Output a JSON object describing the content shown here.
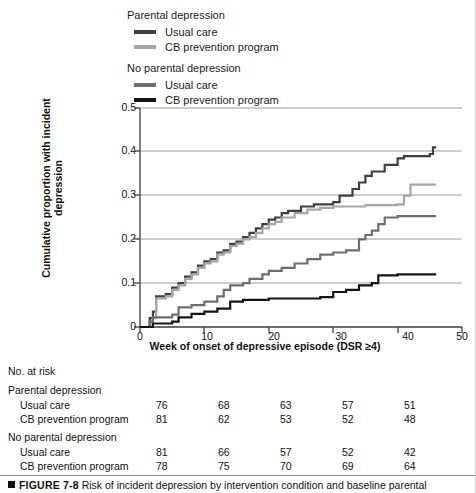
{
  "legend": {
    "groups": [
      {
        "title": "Parental depression",
        "items": [
          {
            "label": "Usual care",
            "color": "#3f3f3f"
          },
          {
            "label": "CB prevention program",
            "color": "#a6a6a6"
          }
        ]
      },
      {
        "title": "No parental depression",
        "items": [
          {
            "label": "Usual care",
            "color": "#6e6e6e"
          },
          {
            "label": "CB prevention program",
            "color": "#141414"
          }
        ]
      }
    ]
  },
  "axes": {
    "ylabel": "Cumulative proportion with incident depression",
    "xlabel": "Week of onset of depressive episode (DSR ≥4)",
    "yticks": [
      "0",
      "0.1",
      "0.2",
      "0.3",
      "0.4",
      "0.5"
    ],
    "xticks": [
      "0",
      "10",
      "20",
      "30",
      "40",
      "50"
    ]
  },
  "risk_table": {
    "title": "No. at risk",
    "sections": [
      {
        "title": "Parental depression",
        "rows": [
          {
            "name": "Usual care",
            "values": [
              "76",
              "68",
              "63",
              "57",
              "51"
            ]
          },
          {
            "name": "CB prevention program",
            "values": [
              "81",
              "62",
              "53",
              "52",
              "48"
            ]
          }
        ]
      },
      {
        "title": "No parental depression",
        "rows": [
          {
            "name": "Usual care",
            "values": [
              "81",
              "66",
              "57",
              "52",
              "42"
            ]
          },
          {
            "name": "CB prevention program",
            "values": [
              "78",
              "75",
              "70",
              "69",
              "64"
            ]
          }
        ]
      }
    ]
  },
  "caption": {
    "figure_number": "FIGURE 7-8",
    "text": "Risk of incident depression by intervention condition and baseline parental"
  },
  "chart_data": {
    "type": "line",
    "title": "",
    "xlabel": "Week of onset of depressive episode (DSR ≥4)",
    "ylabel": "Cumulative proportion with incident depression",
    "xlim": [
      0,
      50
    ],
    "ylim": [
      0,
      0.5
    ],
    "xticks": [
      0,
      10,
      20,
      30,
      40,
      50
    ],
    "yticks": [
      0,
      0.1,
      0.2,
      0.3,
      0.4,
      0.5
    ],
    "grid": "horizontal",
    "legend_position": "above-plot",
    "step_style": "post",
    "series": [
      {
        "name": "Parental depression — Usual care",
        "color": "#3f3f3f",
        "points": [
          [
            0,
            0.0
          ],
          [
            1.5,
            0.02
          ],
          [
            2,
            0.035
          ],
          [
            2.5,
            0.07
          ],
          [
            4,
            0.075
          ],
          [
            5,
            0.09
          ],
          [
            6,
            0.1
          ],
          [
            7,
            0.115
          ],
          [
            8,
            0.125
          ],
          [
            9,
            0.14
          ],
          [
            10,
            0.15
          ],
          [
            11,
            0.155
          ],
          [
            12,
            0.17
          ],
          [
            13,
            0.175
          ],
          [
            14,
            0.19
          ],
          [
            15,
            0.195
          ],
          [
            16,
            0.205
          ],
          [
            17,
            0.215
          ],
          [
            18,
            0.225
          ],
          [
            19,
            0.235
          ],
          [
            20,
            0.245
          ],
          [
            21,
            0.25
          ],
          [
            22,
            0.26
          ],
          [
            23,
            0.265
          ],
          [
            25,
            0.275
          ],
          [
            27,
            0.28
          ],
          [
            30,
            0.285
          ],
          [
            31,
            0.3
          ],
          [
            33,
            0.315
          ],
          [
            34,
            0.33
          ],
          [
            35,
            0.345
          ],
          [
            36,
            0.355
          ],
          [
            38,
            0.37
          ],
          [
            40,
            0.385
          ],
          [
            41,
            0.39
          ],
          [
            45,
            0.395
          ],
          [
            45.5,
            0.41
          ],
          [
            46,
            0.41
          ]
        ]
      },
      {
        "name": "Parental depression — CB prevention program",
        "color": "#a6a6a6",
        "points": [
          [
            0,
            0.0
          ],
          [
            2,
            0.02
          ],
          [
            2.5,
            0.065
          ],
          [
            4,
            0.07
          ],
          [
            5,
            0.085
          ],
          [
            6,
            0.095
          ],
          [
            7,
            0.11
          ],
          [
            8,
            0.12
          ],
          [
            9,
            0.135
          ],
          [
            10,
            0.145
          ],
          [
            11,
            0.15
          ],
          [
            12,
            0.165
          ],
          [
            13,
            0.17
          ],
          [
            14,
            0.185
          ],
          [
            15,
            0.19
          ],
          [
            16,
            0.2
          ],
          [
            17,
            0.205
          ],
          [
            18,
            0.215
          ],
          [
            19,
            0.225
          ],
          [
            20,
            0.235
          ],
          [
            21,
            0.24
          ],
          [
            22,
            0.25
          ],
          [
            24,
            0.26
          ],
          [
            26,
            0.268
          ],
          [
            28,
            0.272
          ],
          [
            30,
            0.275
          ],
          [
            35,
            0.278
          ],
          [
            40,
            0.28
          ],
          [
            41,
            0.3
          ],
          [
            42,
            0.325
          ],
          [
            46,
            0.325
          ]
        ]
      },
      {
        "name": "No parental depression — Usual care",
        "color": "#6e6e6e",
        "points": [
          [
            0,
            0.0
          ],
          [
            1.5,
            0.012
          ],
          [
            2,
            0.022
          ],
          [
            5,
            0.028
          ],
          [
            6,
            0.045
          ],
          [
            8,
            0.05
          ],
          [
            10,
            0.058
          ],
          [
            12,
            0.07
          ],
          [
            13,
            0.085
          ],
          [
            14,
            0.095
          ],
          [
            16,
            0.1
          ],
          [
            17,
            0.11
          ],
          [
            19,
            0.12
          ],
          [
            20,
            0.128
          ],
          [
            22,
            0.135
          ],
          [
            24,
            0.145
          ],
          [
            26,
            0.155
          ],
          [
            28,
            0.165
          ],
          [
            30,
            0.17
          ],
          [
            32,
            0.175
          ],
          [
            34,
            0.2
          ],
          [
            35,
            0.21
          ],
          [
            36,
            0.22
          ],
          [
            37,
            0.235
          ],
          [
            38,
            0.25
          ],
          [
            40,
            0.253
          ],
          [
            46,
            0.253
          ]
        ]
      },
      {
        "name": "No parental depression — CB prevention program",
        "color": "#141414",
        "points": [
          [
            0,
            0.0
          ],
          [
            2,
            0.008
          ],
          [
            5,
            0.012
          ],
          [
            6,
            0.022
          ],
          [
            8,
            0.03
          ],
          [
            10,
            0.035
          ],
          [
            12,
            0.042
          ],
          [
            14,
            0.058
          ],
          [
            16,
            0.062
          ],
          [
            20,
            0.065
          ],
          [
            28,
            0.068
          ],
          [
            30,
            0.08
          ],
          [
            32,
            0.085
          ],
          [
            34,
            0.095
          ],
          [
            36,
            0.1
          ],
          [
            37,
            0.118
          ],
          [
            40,
            0.12
          ],
          [
            46,
            0.12
          ]
        ]
      }
    ]
  }
}
